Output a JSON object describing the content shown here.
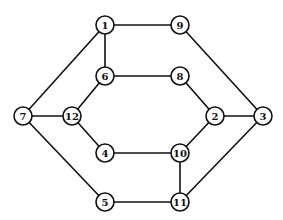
{
  "graph": {
    "node_radius": 9,
    "nodes": [
      {
        "id": "1",
        "label": "1",
        "x": 105,
        "y": 25
      },
      {
        "id": "9",
        "label": "9",
        "x": 180,
        "y": 25
      },
      {
        "id": "6",
        "label": "6",
        "x": 105,
        "y": 76
      },
      {
        "id": "8",
        "label": "8",
        "x": 180,
        "y": 76
      },
      {
        "id": "7",
        "label": "7",
        "x": 23,
        "y": 116
      },
      {
        "id": "12",
        "label": "12",
        "x": 72,
        "y": 116
      },
      {
        "id": "2",
        "label": "2",
        "x": 215,
        "y": 116
      },
      {
        "id": "3",
        "label": "3",
        "x": 263,
        "y": 116
      },
      {
        "id": "4",
        "label": "4",
        "x": 105,
        "y": 153
      },
      {
        "id": "10",
        "label": "10",
        "x": 180,
        "y": 153
      },
      {
        "id": "5",
        "label": "5",
        "x": 105,
        "y": 202
      },
      {
        "id": "11",
        "label": "11",
        "x": 180,
        "y": 202
      }
    ],
    "edges": [
      [
        "1",
        "9"
      ],
      [
        "1",
        "6"
      ],
      [
        "1",
        "7"
      ],
      [
        "9",
        "3"
      ],
      [
        "6",
        "8"
      ],
      [
        "6",
        "12"
      ],
      [
        "8",
        "2"
      ],
      [
        "7",
        "12"
      ],
      [
        "7",
        "5"
      ],
      [
        "12",
        "4"
      ],
      [
        "2",
        "3"
      ],
      [
        "2",
        "10"
      ],
      [
        "4",
        "10"
      ],
      [
        "10",
        "11"
      ],
      [
        "3",
        "11"
      ],
      [
        "5",
        "11"
      ]
    ]
  }
}
